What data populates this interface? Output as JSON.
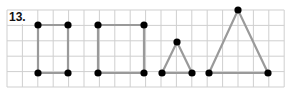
{
  "problem": {
    "number_label": "13."
  },
  "grid": {
    "x0": 7,
    "y0": 10,
    "cell": 15.4,
    "cols": 18,
    "rows": 5,
    "line_color": "#cfcfcf"
  },
  "colors": {
    "segment": "#9a9a9a",
    "point": "#000000"
  },
  "shapes": [
    {
      "name": "rectangle-1",
      "type": "polygon",
      "points": [
        [
          38,
          25
        ],
        [
          68,
          25
        ],
        [
          68,
          73
        ],
        [
          38,
          73
        ]
      ]
    },
    {
      "name": "rectangle-2",
      "type": "polygon",
      "points": [
        [
          98,
          25
        ],
        [
          144,
          25
        ],
        [
          144,
          73
        ],
        [
          98,
          73
        ]
      ]
    },
    {
      "name": "small-triangle",
      "type": "polygon",
      "points": [
        [
          162,
          73
        ],
        [
          177,
          42
        ],
        [
          192,
          73
        ]
      ]
    },
    {
      "name": "large-triangle",
      "type": "polygon",
      "points": [
        [
          209,
          73
        ],
        [
          238,
          10
        ],
        [
          268,
          73
        ]
      ]
    }
  ]
}
